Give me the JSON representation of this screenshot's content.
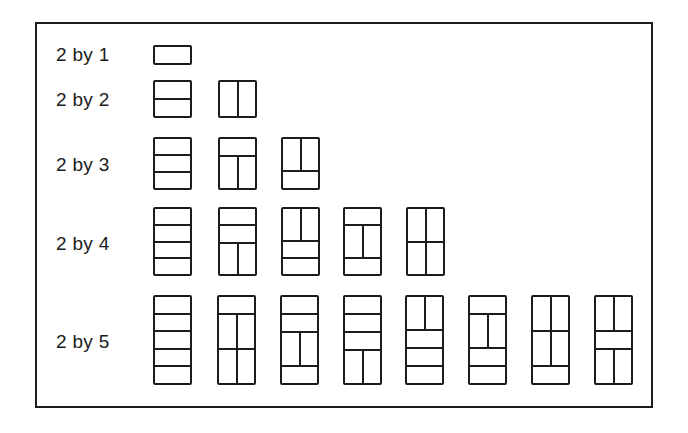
{
  "figure": {
    "stroke_color": "#1c1c1c",
    "background": "#ffffff",
    "rows": [
      {
        "label": "2 by 1",
        "label_y": 45,
        "tile_top": 45,
        "tile_height": 20,
        "tile_width": 39,
        "orientation": "horizontal",
        "tilings": [
          {
            "x": 153,
            "segments": [
              "H"
            ]
          }
        ]
      },
      {
        "label": "2 by 2",
        "label_y": 90,
        "tile_top": 80,
        "tile_height": 38,
        "tile_width": 39,
        "tilings": [
          {
            "x": 153,
            "segments": [
              "H",
              "H"
            ]
          },
          {
            "x": 218,
            "segments": [
              "V"
            ]
          }
        ]
      },
      {
        "label": "2 by 3",
        "label_y": 155,
        "tile_top": 137,
        "tile_height": 53,
        "tile_width": 39,
        "tilings": [
          {
            "x": 153,
            "segments": [
              "H",
              "H",
              "H"
            ]
          },
          {
            "x": 218,
            "segments": [
              "H",
              "V"
            ]
          },
          {
            "x": 281,
            "segments": [
              "V",
              "H"
            ]
          }
        ]
      },
      {
        "label": "2 by 4",
        "label_y": 234,
        "tile_top": 207,
        "tile_height": 69,
        "tile_width": 39,
        "tilings": [
          {
            "x": 153,
            "segments": [
              "H",
              "H",
              "H",
              "H"
            ]
          },
          {
            "x": 218,
            "segments": [
              "H",
              "H",
              "V"
            ]
          },
          {
            "x": 281,
            "segments": [
              "V",
              "H",
              "H"
            ]
          },
          {
            "x": 343,
            "segments": [
              "H",
              "V",
              "H"
            ]
          },
          {
            "x": 406,
            "segments": [
              "V",
              "V"
            ]
          }
        ]
      },
      {
        "label": "2 by 5",
        "label_y": 332,
        "tile_top": 295,
        "tile_height": 90,
        "tile_width": 39,
        "tilings": [
          {
            "x": 153,
            "segments": [
              "H",
              "H",
              "H",
              "H",
              "H"
            ]
          },
          {
            "x": 217,
            "segments": [
              "H",
              "V",
              "V"
            ]
          },
          {
            "x": 280,
            "segments": [
              "H",
              "H",
              "V",
              "H"
            ]
          },
          {
            "x": 343,
            "segments": [
              "H",
              "H",
              "H",
              "V"
            ]
          },
          {
            "x": 405,
            "segments": [
              "V",
              "H",
              "H",
              "H"
            ]
          },
          {
            "x": 468,
            "segments": [
              "H",
              "V",
              "H",
              "H"
            ]
          },
          {
            "x": 531,
            "segments": [
              "V",
              "V",
              "H"
            ]
          },
          {
            "x": 594,
            "segments": [
              "V",
              "H",
              "V"
            ]
          }
        ]
      }
    ]
  }
}
